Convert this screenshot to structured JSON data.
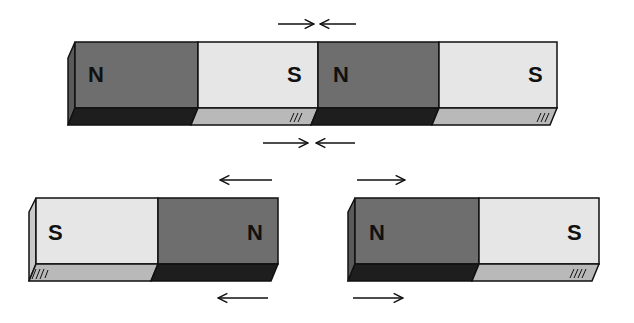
{
  "colors": {
    "north_face": "#6e6e6e",
    "north_bottom": "#1e1e1e",
    "south_face": "#e6e6e6",
    "south_bottom": "#b9b9b9",
    "outline": "#111111",
    "background": "#ffffff"
  },
  "top_magnet_pair": {
    "description": "Two magnets joined S-to-N, forming one long bar",
    "segments": [
      "N",
      "S",
      "N",
      "S"
    ],
    "arrows_top": {
      "left": "→",
      "right": "←"
    },
    "arrows_bottom": {
      "left": "→",
      "right": "←"
    }
  },
  "bottom_left_magnet": {
    "segments": [
      "S",
      "N"
    ],
    "arrow_top": "←",
    "arrow_bottom": "←"
  },
  "bottom_right_magnet": {
    "segments": [
      "N",
      "S"
    ],
    "arrow_top": "→",
    "arrow_bottom": "→"
  }
}
